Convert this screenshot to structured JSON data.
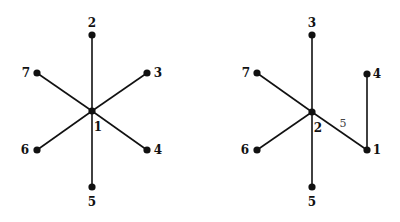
{
  "diagrams": [
    {
      "name": "star-tree-left",
      "nodes": [
        {
          "id": "1",
          "x": 92,
          "y": 111,
          "lx": 98,
          "ly": 131
        },
        {
          "id": "2",
          "x": 92,
          "y": 35,
          "lx": 92,
          "ly": 27
        },
        {
          "id": "3",
          "x": 147,
          "y": 73,
          "lx": 158,
          "ly": 77
        },
        {
          "id": "4",
          "x": 147,
          "y": 150,
          "lx": 158,
          "ly": 154
        },
        {
          "id": "5",
          "x": 92,
          "y": 187,
          "lx": 92,
          "ly": 206
        },
        {
          "id": "6",
          "x": 37,
          "y": 150,
          "lx": 25,
          "ly": 154
        },
        {
          "id": "7",
          "x": 37,
          "y": 73,
          "lx": 26,
          "ly": 77
        }
      ],
      "edges": [
        [
          "1",
          "2"
        ],
        [
          "1",
          "3"
        ],
        [
          "1",
          "4"
        ],
        [
          "1",
          "5"
        ],
        [
          "1",
          "6"
        ],
        [
          "1",
          "7"
        ]
      ],
      "edge_labels": []
    },
    {
      "name": "tree-right",
      "nodes": [
        {
          "id": "2",
          "x": 312,
          "y": 112,
          "lx": 318,
          "ly": 132
        },
        {
          "id": "3",
          "x": 312,
          "y": 35,
          "lx": 312,
          "ly": 27
        },
        {
          "id": "4",
          "x": 367,
          "y": 74,
          "lx": 377,
          "ly": 78
        },
        {
          "id": "1",
          "x": 367,
          "y": 150,
          "lx": 377,
          "ly": 154
        },
        {
          "id": "5",
          "x": 312,
          "y": 187,
          "lx": 312,
          "ly": 206
        },
        {
          "id": "6",
          "x": 257,
          "y": 150,
          "lx": 245,
          "ly": 154
        },
        {
          "id": "7",
          "x": 257,
          "y": 73,
          "lx": 246,
          "ly": 77
        }
      ],
      "edges": [
        [
          "2",
          "3"
        ],
        [
          "2",
          "7"
        ],
        [
          "2",
          "6"
        ],
        [
          "2",
          "5"
        ],
        [
          "2",
          "1"
        ],
        [
          "1",
          "4"
        ]
      ],
      "edge_labels": [
        {
          "text": "5",
          "x": 343,
          "y": 127
        }
      ]
    }
  ]
}
